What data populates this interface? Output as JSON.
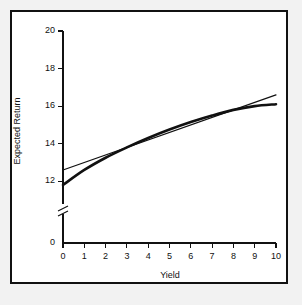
{
  "figure": {
    "background_color": "#f2f2f2",
    "panel_color": "#ffffff",
    "frame_color": "#111111",
    "ink_color": "#111111"
  },
  "chart_data": {
    "type": "line",
    "title": "",
    "xlabel": "Yield",
    "ylabel": "Expected Return",
    "xlim": [
      0,
      10
    ],
    "ylim": [
      0,
      20
    ],
    "grid": false,
    "legend": null,
    "xticks": [
      0,
      1,
      2,
      3,
      4,
      5,
      6,
      7,
      8,
      9,
      10
    ],
    "xtick_labels": [
      "0",
      "1",
      "2",
      "3",
      "4",
      "5",
      "6",
      "7",
      "8",
      "9",
      "10"
    ],
    "yticks": [
      0,
      12,
      14,
      16,
      18,
      20
    ],
    "ytick_labels": [
      "0",
      "12",
      "14",
      "16",
      "18",
      "20"
    ],
    "axis_break": {
      "present": true,
      "axis": "y",
      "between": [
        0,
        11
      ],
      "style": "double-slash"
    },
    "x": [
      0,
      1,
      2,
      3,
      4,
      5,
      6,
      7,
      8,
      9,
      10
    ],
    "series": [
      {
        "name": "fitted-curve",
        "style": "curve",
        "line_width": 2.6,
        "color": "#111111",
        "values": [
          11.8,
          12.6,
          13.25,
          13.8,
          14.3,
          14.75,
          15.15,
          15.5,
          15.8,
          16.0,
          16.1
        ]
      },
      {
        "name": "regression-line",
        "style": "straight",
        "line_width": 1.2,
        "color": "#111111",
        "values": [
          12.6,
          13.0,
          13.4,
          13.8,
          14.2,
          14.6,
          15.0,
          15.4,
          15.8,
          16.2,
          16.6
        ]
      }
    ]
  }
}
